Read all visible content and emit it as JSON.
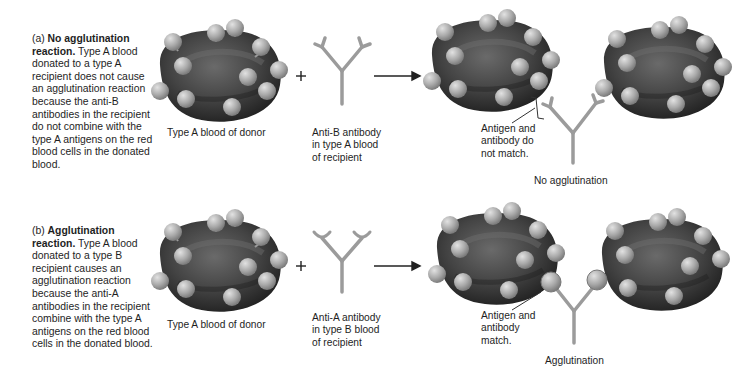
{
  "panels": [
    {
      "id": "a",
      "prefix": "(a) ",
      "title": "No agglutination reaction.",
      "description": " Type A blood donated to a type A recipient does not cause an agglutination reaction because the anti-B antibodies in the recipient do not combine with the type A antigens on the red blood cells in the donated blood.",
      "donor_label": "Type A blood of donor",
      "plus": "+",
      "antibody_label": [
        "Anti-B antibody",
        "in type A blood",
        "of recipient"
      ],
      "callout": [
        "Antigen and",
        "antibody do",
        "not match."
      ],
      "result": "No agglutination"
    },
    {
      "id": "b",
      "prefix": "(b) ",
      "title": "Agglutination reaction.",
      "description": " Type A blood donated to a type B recipient causes an agglutination reaction because the anti-A antibodies in the recipient combine with the type A antigens on the red blood cells in the donated blood.",
      "donor_label": "Type A blood of donor",
      "plus": "+",
      "antibody_label": [
        "Anti-A antibody",
        "in type B blood",
        "of recipient"
      ],
      "callout": [
        "Antigen and",
        "antibody",
        "match."
      ],
      "result": "Agglutination"
    }
  ],
  "colors": {
    "cell_dark": "#2e2e2e",
    "cell_mid": "#5a5a5a",
    "antigen": "#a8a8a8",
    "antibody": "#9a9a9a",
    "text": "#1e1e1e"
  }
}
